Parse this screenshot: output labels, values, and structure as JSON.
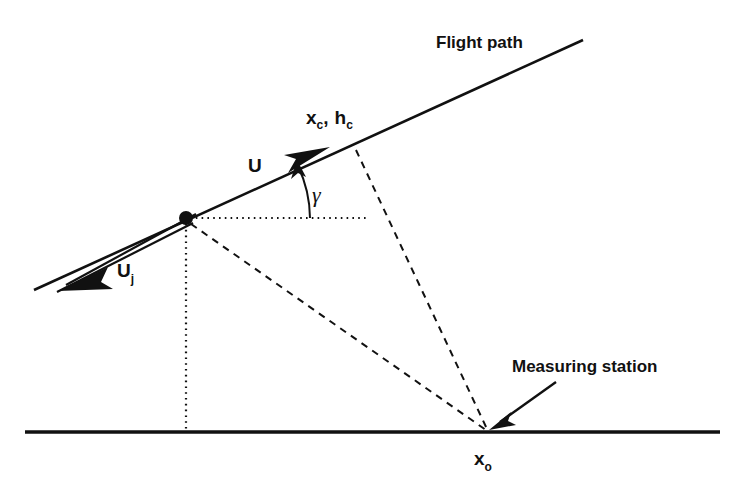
{
  "figure": {
    "background_color": "#ffffff",
    "ink_color": "#111111"
  },
  "labels": {
    "flight_path": "Flight path",
    "measuring_station": "Measuring station",
    "emission_point_x": "x",
    "emission_point_x_sub": "c",
    "emission_point_comma": ",",
    "emission_point_h": "h",
    "emission_point_h_sub": "c",
    "aircraft_speed": "U",
    "jet_speed": "U",
    "jet_speed_sub": "j",
    "flight_path_angle": "γ",
    "station_x": "x",
    "station_x_sub": "o"
  },
  "geometry": {
    "ground_line": {
      "x1": 25,
      "y1": 432,
      "x2": 720,
      "y2": 432,
      "width": 3.6
    },
    "flight_path_line": {
      "x1": 34,
      "y1": 290,
      "x2": 583,
      "y2": 40,
      "width": 2.6
    },
    "aircraft_node": {
      "x": 186,
      "y": 218,
      "r": 7
    },
    "emission_point": {
      "x": 353,
      "y": 146
    },
    "station_point": {
      "x": 488,
      "y": 431
    },
    "horizontal_dotted": {
      "x1": 190,
      "y1": 218,
      "x2": 368,
      "y2": 218
    },
    "vertical_dotted": {
      "x1": 186,
      "y1": 222,
      "x2": 186,
      "y2": 430
    },
    "dashed_emission_to_station": {
      "x1": 356,
      "y1": 150,
      "x2": 487,
      "y2": 429
    },
    "dashed_node_to_station": {
      "x1": 190,
      "y1": 223,
      "x2": 486,
      "y2": 430
    },
    "angle_arc": {
      "cx": 186,
      "cy": 218,
      "radius": 124,
      "start_deg": 0,
      "end_deg": 24.5
    },
    "u_arrow_tip": {
      "x": 327,
      "y": 150
    },
    "uj_arrow_tip": {
      "x": 60,
      "y": 289
    },
    "station_callout_arrow": {
      "x1": 556,
      "y1": 382,
      "x2": 492,
      "y2": 428
    }
  },
  "label_positions": {
    "flight_path": {
      "x": 436,
      "y": 48
    },
    "measuring_station": {
      "x": 512,
      "y": 372
    },
    "emission_point": {
      "x": 306,
      "y": 124
    },
    "aircraft_speed": {
      "x": 248,
      "y": 172
    },
    "jet_speed": {
      "x": 117,
      "y": 277
    },
    "flight_path_angle": {
      "x": 312,
      "y": 202
    },
    "station_x": {
      "x": 474,
      "y": 465
    }
  }
}
